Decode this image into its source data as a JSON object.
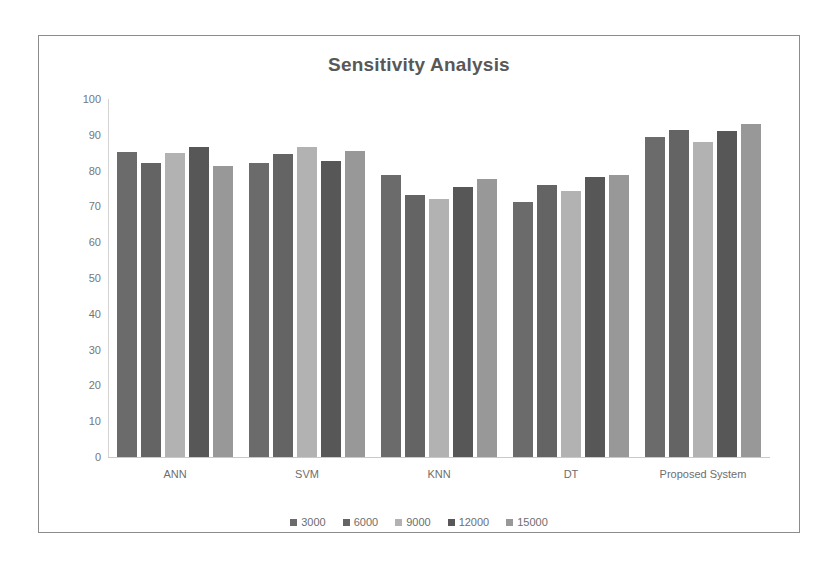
{
  "chart_data": {
    "type": "bar",
    "title": "Sensitivity Analysis",
    "xlabel": "",
    "ylabel": "",
    "ylim": [
      0,
      100
    ],
    "yticks": [
      100,
      90,
      80,
      70,
      60,
      50,
      40,
      30,
      20,
      10,
      0
    ],
    "grid": false,
    "legend_position": "bottom",
    "categories": [
      "ANN",
      "SVM",
      "KNN",
      "DT",
      "Proposed System"
    ],
    "series": [
      {
        "name": "3000",
        "color": "#6b6b6b",
        "values": [
          85.3,
          82.2,
          78.7,
          71.3,
          89.3
        ]
      },
      {
        "name": "6000",
        "color": "#646464",
        "values": [
          82.2,
          84.6,
          73.3,
          76.0,
          91.3
        ]
      },
      {
        "name": "9000",
        "color": "#b2b2b2",
        "values": [
          85.0,
          86.6,
          72.0,
          74.3,
          88.0
        ]
      },
      {
        "name": "12000",
        "color": "#575757",
        "values": [
          86.6,
          82.6,
          75.3,
          78.3,
          91.0
        ]
      },
      {
        "name": "15000",
        "color": "#989898",
        "values": [
          81.4,
          85.6,
          77.6,
          78.8,
          93.0
        ]
      }
    ]
  },
  "colors": {
    "frame_border": "#8c8c8c",
    "axis": "#c9c9c9",
    "title_text": "#585858",
    "tick_text": "#767676",
    "background": "#ffffff"
  }
}
